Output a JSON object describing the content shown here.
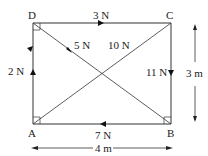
{
  "figure": {
    "type": "force-diagram-rectangle",
    "corners": {
      "A": "A",
      "B": "B",
      "C": "C",
      "D": "D"
    },
    "forces": [
      {
        "id": "DC",
        "label": "3 N",
        "from": "D",
        "to": "C",
        "direction": "D to C"
      },
      {
        "id": "CB",
        "label": "11 N",
        "from": "C",
        "to": "B",
        "direction": "C to B"
      },
      {
        "id": "BA",
        "label": "7 N",
        "from": "B",
        "to": "A",
        "direction": "B to A"
      },
      {
        "id": "AD",
        "label": "2 N",
        "from": "A",
        "to": "D",
        "direction": "A to D"
      },
      {
        "id": "BD",
        "label": "5 N",
        "from": "B",
        "to": "D",
        "direction": "B to D"
      },
      {
        "id": "CA",
        "label": "10 N",
        "from": "C",
        "to": "A",
        "direction": "C to A"
      }
    ],
    "dimensions": {
      "height": "3 m",
      "width": "4 m"
    },
    "colors": {
      "line": "#333333",
      "background": "#ffffff"
    }
  }
}
